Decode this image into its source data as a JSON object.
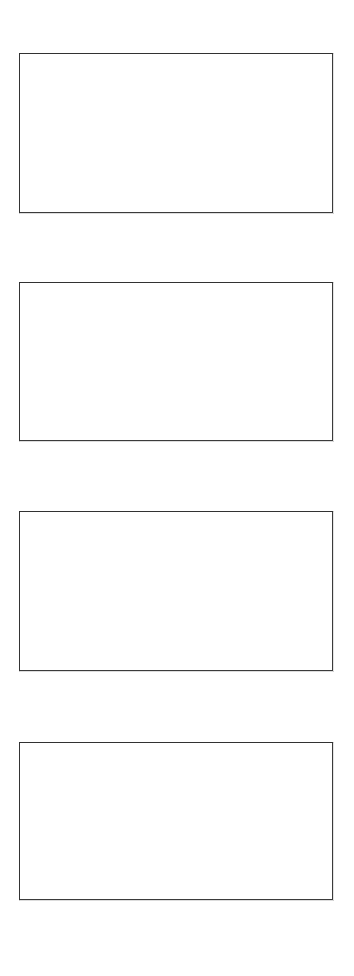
{
  "page": {
    "background_color": "#ffffff",
    "width": 354,
    "height": 976,
    "title": "",
    "content_text": ""
  },
  "style": {
    "border_color": "#3b3b3b",
    "border_width_px": 1.5,
    "panel_fill_color": "#ffffff"
  },
  "panels": [
    {
      "id": "panel-1",
      "label": "",
      "content_text": "",
      "x": 19,
      "y": 53,
      "width": 314,
      "height": 160
    },
    {
      "id": "panel-2",
      "label": "",
      "content_text": "",
      "x": 19,
      "y": 282,
      "width": 314,
      "height": 159
    },
    {
      "id": "panel-3",
      "label": "",
      "content_text": "",
      "x": 19,
      "y": 511,
      "width": 314,
      "height": 160
    },
    {
      "id": "panel-4",
      "label": "",
      "content_text": "",
      "x": 19,
      "y": 742,
      "width": 314,
      "height": 158
    }
  ]
}
